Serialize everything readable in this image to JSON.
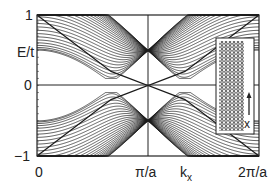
{
  "chart_data": {
    "type": "line",
    "title": "",
    "xlabel": "k_x",
    "ylabel": "E/t",
    "xlim": [
      0,
      6.2832
    ],
    "ylim": [
      -1,
      1
    ],
    "x_ticks": [
      "0",
      "π/a",
      "2π/a"
    ],
    "y_ticks": [
      "1",
      "0",
      "-1"
    ],
    "grid": false,
    "legend": null,
    "num_subbands": 30,
    "series": [
      {
        "name": "upper subbands",
        "shape": "cosine-like bands reaching minimum near k=2π/3a and k=4π/3a, saturating at E/t=1 near k=0, π/a and 2π/a"
      },
      {
        "name": "lower subbands",
        "shape": "mirror of upper subbands about E=0"
      },
      {
        "name": "edge states",
        "shape": "two bands touching E=0 between 2π/3a and 4π/3a, crossing linearly at k=π/a"
      }
    ],
    "annotations": [
      {
        "type": "vertical_line",
        "x": "π/a"
      },
      {
        "type": "horizontal_line",
        "y": 0
      },
      {
        "type": "inset",
        "content": "honeycomb ribbon lattice with arrow labeled x"
      }
    ]
  },
  "labels": {
    "y_top": "1",
    "y_label": "E/t",
    "y_zero": "0",
    "y_bottom": "−1",
    "x_zero": "0",
    "x_mid": "π/a",
    "x_label_k": "k",
    "x_label_sub": "x",
    "x_end": "2π/a",
    "inset_axis": "x"
  },
  "colors": {
    "line": "#1a1a1a",
    "frame": "#222222",
    "background": "#ffffff"
  }
}
